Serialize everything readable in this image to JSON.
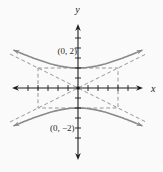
{
  "chart_data": {
    "type": "line",
    "equation": "y^2/4 - x^2/16 = 1",
    "axis_labels": {
      "x": "x",
      "y": "y"
    },
    "vertices": [
      [
        0,
        2
      ],
      [
        0,
        -2
      ]
    ],
    "vertex_labels": [
      "(0, 2)",
      "(0, −2)"
    ],
    "central_rectangle": {
      "x_range": [
        -4,
        4
      ],
      "y_range": [
        -2,
        2
      ],
      "style": "dashed"
    },
    "asymptote_slopes": [
      0.5,
      -0.5
    ],
    "x_ticks": [
      -5,
      -4,
      -3,
      -2,
      -1,
      1,
      2,
      3,
      4,
      5
    ],
    "y_ticks": [
      -5,
      -4,
      -3,
      -2,
      -1,
      1,
      2,
      3,
      4,
      5
    ],
    "xlim": [
      -6.6,
      6.5
    ],
    "ylim": [
      -7.2,
      6.4
    ],
    "grid": false,
    "legend": false,
    "colors": {
      "axes": "#1c1c1c",
      "curve": "#8a8a8a",
      "dashed": "#979797",
      "text": "#2a2a2a",
      "background": "#fafafa"
    }
  }
}
